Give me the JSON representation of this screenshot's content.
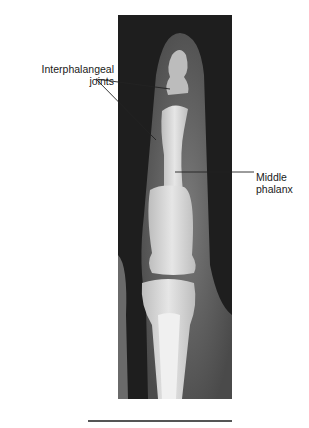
{
  "figure": {
    "type": "radiograph",
    "labels": [
      {
        "id": "interphalangeal",
        "lines": [
          "Interphalangeal",
          "joints"
        ]
      },
      {
        "id": "middle-phalanx",
        "lines": [
          "Middle",
          "phalanx"
        ]
      }
    ]
  },
  "colors": {
    "background": "#ffffff",
    "xray_dark": "#1c1c1c",
    "bone": "#d8d8d8",
    "leader": "#222222",
    "rule": "#555555"
  }
}
